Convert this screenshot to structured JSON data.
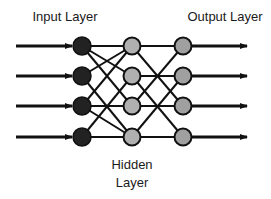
{
  "diagram": {
    "labels": {
      "input_layer": "Input Layer",
      "output_layer": "Output Layer",
      "hidden_layer_line1": "Hidden",
      "hidden_layer_line2": "Layer"
    },
    "layers": [
      {
        "name": "input",
        "node_count": 4,
        "fill": "#222222"
      },
      {
        "name": "hidden",
        "node_count": 4,
        "fill": "#b0b0b0"
      },
      {
        "name": "output",
        "node_count": 4,
        "fill": "#a0a0a0"
      }
    ],
    "input_arrows": 4,
    "output_arrows": 4,
    "colors": {
      "stroke": "#111111",
      "input_node": "#222222",
      "hidden_node": "#b0b0b0",
      "output_node": "#a0a0a0",
      "background": "#ffffff"
    }
  }
}
